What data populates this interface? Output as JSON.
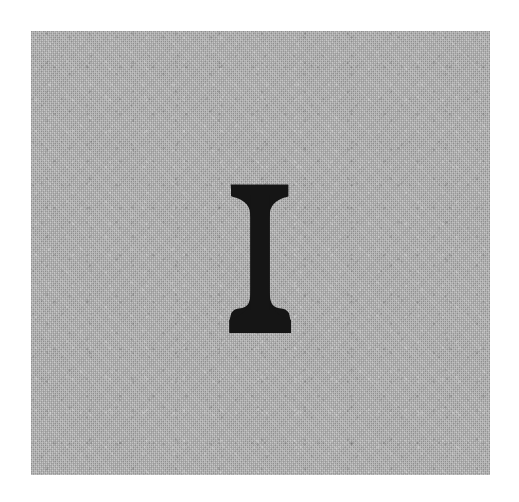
{
  "artwork": {
    "glyph": "I",
    "glyph_name": "latin-capital-letter-i",
    "glyph_style": "serif-slab-bracketed",
    "glyph_color": "#151515",
    "caption": ""
  },
  "panel": {
    "background_color": "#ababab",
    "texture": "fine-woven-canvas-grain",
    "label": ""
  },
  "page": {
    "background_color": "#ffffff",
    "width": 519,
    "height": 502
  },
  "geometry": {
    "panel_left": 31,
    "panel_top": 31,
    "panel_width": 459,
    "panel_height": 444,
    "glyph_top": 184,
    "glyph_bottom": 333,
    "stem_left": 248,
    "stem_right": 272,
    "serif_left": 230,
    "serif_right": 290
  }
}
